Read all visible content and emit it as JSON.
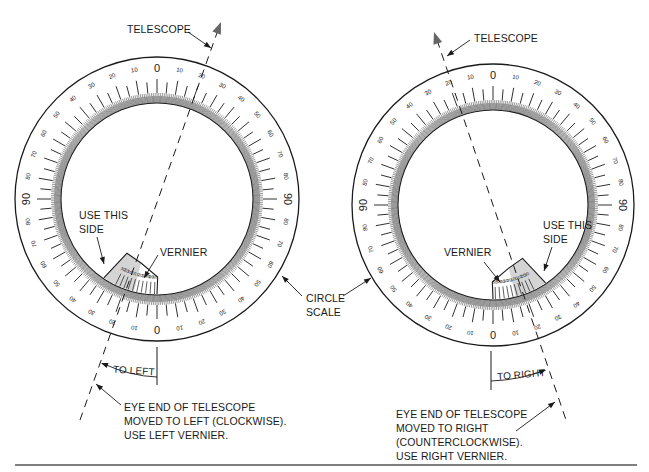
{
  "colors": {
    "ink": "#1a1a1a",
    "vernier_fill": "#d4d4d4",
    "arrow_gray": "#666666",
    "rule": "#555555"
  },
  "scale": {
    "label_step": 10,
    "major_tick_step": 5,
    "fine_tick_step": 1,
    "quadrant_labels": [
      "0",
      "10",
      "20",
      "30",
      "40",
      "50",
      "60",
      "70",
      "80",
      "90"
    ]
  },
  "left_diagram": {
    "center": [
      157,
      199
    ],
    "outer_radius": 142,
    "telescope_label": "TELESCOPE",
    "use_this_side_label": [
      "USE THIS",
      "SIDE"
    ],
    "vernier_label": "VERNIER",
    "direction_label": "TO LEFT",
    "vernier_marks": [
      "60",
      "50",
      "40",
      "30",
      "20",
      "10",
      "0",
      "10",
      "20",
      "30"
    ],
    "caption": [
      "EYE END OF TELESCOPE",
      "MOVED TO LEFT (CLOCKWISE).",
      "USE LEFT VERNIER."
    ]
  },
  "right_diagram": {
    "center": [
      493,
      205
    ],
    "outer_radius": 141,
    "telescope_label": "TELESCOPE",
    "use_this_side_label": [
      "USE THIS",
      "SIDE"
    ],
    "vernier_label": "VERNIER",
    "direction_label": "TO RIGHT",
    "vernier_marks": [
      "30",
      "20",
      "10",
      "0",
      "10",
      "20",
      "30",
      "40",
      "50",
      "60"
    ],
    "caption": [
      "EYE END OF TELESCOPE",
      "MOVED TO RIGHT",
      "(COUNTERCLOCKWISE).",
      "USE RIGHT VERNIER."
    ]
  },
  "shared": {
    "circle_scale_label": [
      "CIRCLE",
      "SCALE"
    ]
  }
}
